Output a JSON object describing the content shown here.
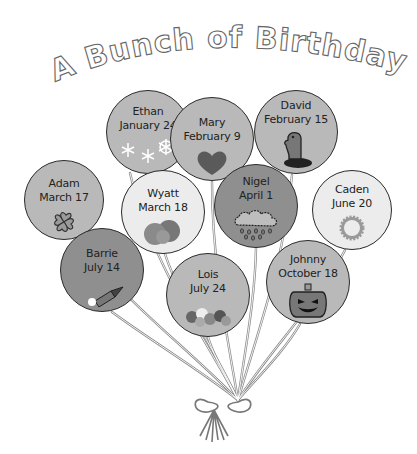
{
  "title": "A Bunch of Birthdays!",
  "colors": {
    "balloon_mid": "#b9b9b9",
    "balloon_light": "#ececec",
    "balloon_dark": "#8f8f8f",
    "outline": "#2a2a2a",
    "background": "#ffffff"
  },
  "balloons": [
    {
      "name": "Ethan",
      "date": "January 24",
      "icon": "snowflakes-icon",
      "shade": "mid"
    },
    {
      "name": "Mary",
      "date": "February 9",
      "icon": "heart-icon",
      "shade": "mid"
    },
    {
      "name": "David",
      "date": "February 15",
      "icon": "groundhog-icon",
      "shade": "mid"
    },
    {
      "name": "Adam",
      "date": "March 17",
      "icon": "shamrock-icon",
      "shade": "mid"
    },
    {
      "name": "Wyatt",
      "date": "March 18",
      "icon": "bush-icon",
      "shade": "light"
    },
    {
      "name": "Nigel",
      "date": "April 1",
      "icon": "rain-cloud-icon",
      "shade": "dark"
    },
    {
      "name": "Caden",
      "date": "June 20",
      "icon": "sun-icon",
      "shade": "light"
    },
    {
      "name": "Barrie",
      "date": "July 14",
      "icon": "firework-rocket-icon",
      "shade": "dark"
    },
    {
      "name": "Lois",
      "date": "July 24",
      "icon": "flowers-icon",
      "shade": "mid"
    },
    {
      "name": "Johnny",
      "date": "October 18",
      "icon": "jack-o-lantern-icon",
      "shade": "mid"
    }
  ]
}
